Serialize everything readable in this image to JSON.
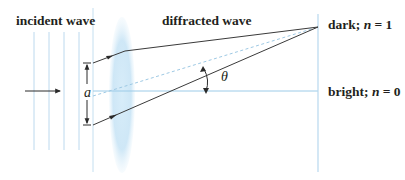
{
  "labels": {
    "incident_wave": "incident wave",
    "diffracted_wave": "diffracted wave",
    "dark_prefix": "dark; ",
    "dark_n": "n",
    "dark_suffix": " = 1",
    "bright_prefix": "bright; ",
    "bright_n": "n",
    "bright_suffix": " = 0",
    "slit_width": "a",
    "angle": "θ"
  },
  "colors": {
    "wavefront": "#bcd9ee",
    "axis": "#9ccbe8",
    "ray": "#3a3a3a",
    "dashed": "#9ec9e4",
    "lens": "#cfe7f6",
    "text": "#231f20"
  },
  "elements": {
    "wavefronts_count": 4,
    "slit_edge": "vertical screen with aperture of width a",
    "lens": "converging lens",
    "screen": "observation screen",
    "rays": [
      "top edge ray",
      "bottom edge ray",
      "central dashed ray"
    ]
  }
}
